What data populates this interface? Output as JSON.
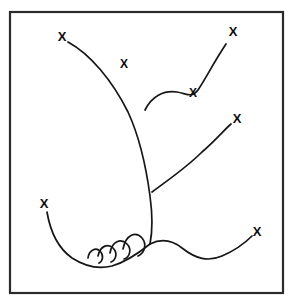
{
  "figure": {
    "background_color": "#ffffff",
    "stroke_color": "#161616",
    "frame_color": "#2b2b2b",
    "label_color": "#0d0d0d",
    "frame": {
      "x": 10,
      "y": 12,
      "width": 273,
      "height": 281,
      "stroke_width": 2.2
    }
  },
  "markers": [
    {
      "id": "marker-upper-left-tip",
      "label": "X",
      "x": 62,
      "y": 38,
      "font_size": 13,
      "description": "tip of long left-sweeping upper branch"
    },
    {
      "id": "marker-upper-left-mid",
      "label": "X",
      "x": 124,
      "y": 65,
      "font_size": 12,
      "description": "label floating beside upper left branch"
    },
    {
      "id": "marker-upper-right-tip",
      "label": "X",
      "x": 233,
      "y": 33,
      "font_size": 13,
      "description": "tip of upper right branch"
    },
    {
      "id": "marker-upper-right-mid",
      "label": "X",
      "x": 193,
      "y": 94,
      "font_size": 12,
      "description": "inflection point on upper right branch"
    },
    {
      "id": "marker-middle-right-tip",
      "label": "X",
      "x": 237,
      "y": 120,
      "font_size": 13,
      "description": "tip of middle right branch"
    },
    {
      "id": "marker-lower-left-tip",
      "label": "X",
      "x": 44,
      "y": 205,
      "font_size": 13,
      "description": "tip of lower left sweeping branch"
    },
    {
      "id": "marker-lower-right-tip",
      "label": "X",
      "x": 257,
      "y": 233,
      "font_size": 13,
      "description": "tip of lower right S-curve branch"
    }
  ],
  "curves": [
    {
      "id": "main-stem",
      "stroke_width": 1.7,
      "path": "M 68 42 C 90 54 112 80 128 112 C 140 138 146 166 150 196 C 153 218 152 234 150 244",
      "description": "main curved stem running from upper left tip down to base"
    },
    {
      "id": "branch-upper-right",
      "stroke_width": 1.7,
      "path": "M 145 110 C 152 96 164 90 177 92 C 188 94 192 98 198 90 C 206 78 214 62 226 44",
      "description": "first right branch with S inflection ending at upper right X"
    },
    {
      "id": "branch-middle-right",
      "stroke_width": 1.7,
      "path": "M 152 192 C 168 180 186 168 202 152 C 216 140 224 130 231 124",
      "description": "second right branch ending at middle right X"
    },
    {
      "id": "branch-lower-right",
      "stroke_width": 1.7,
      "path": "M 150 244 C 162 238 172 240 182 248 C 196 259 208 262 222 256 C 236 250 246 242 252 236",
      "description": "lower right S-curve branch ending at lower right X"
    },
    {
      "id": "branch-lower-left",
      "stroke_width": 1.7,
      "path": "M 47 212 C 50 230 58 248 72 258 C 86 267 100 269 112 266 C 126 262 140 252 150 244",
      "description": "lower left sweeping branch forming the basal bowl"
    }
  ],
  "arches": [
    {
      "id": "arch-1",
      "stroke_width": 1.7,
      "path": "M 88 258 C 89 250 96 247 100 251 C 104 255 103 261 99 263",
      "description": "smallest scalloped arch, leftmost"
    },
    {
      "id": "arch-2",
      "stroke_width": 1.7,
      "path": "M 98 256 C 100 246 108 243 113 248 C 118 253 116 260 111 262",
      "description": "second scalloped arch"
    },
    {
      "id": "arch-3",
      "stroke_width": 1.7,
      "path": "M 110 253 C 112 241 121 238 127 244 C 132 249 130 257 124 259",
      "description": "third scalloped arch"
    },
    {
      "id": "arch-4",
      "stroke_width": 1.7,
      "path": "M 123 249 C 126 234 136 231 142 238 C 147 244 145 253 138 256",
      "description": "largest scalloped arch, rightmost near base junction"
    }
  ]
}
